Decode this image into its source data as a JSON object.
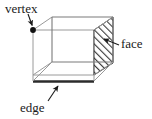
{
  "figure": {
    "shape": "cube",
    "background_color": "#ffffff",
    "line_color": "#808080",
    "bold_line_color": "#303030",
    "hatch_color": "#3a3a3a",
    "text_color": "#1a1a1a",
    "labels": {
      "vertex": "vertex",
      "face": "face",
      "edge": "edge"
    },
    "annotations": [
      {
        "name": "vertex",
        "label": "vertex",
        "target": "back-top-left corner dot",
        "marker": "filled-dot",
        "arrow_direction": "down-right"
      },
      {
        "name": "face",
        "label": "face",
        "target": "right side face (hatched)",
        "marker": "hatched-parallelogram",
        "arrow_direction": "left-down"
      },
      {
        "name": "edge",
        "label": "edge",
        "target": "bottom front edge (bold)",
        "marker": "thick-line",
        "arrow_direction": "up-right"
      }
    ]
  }
}
